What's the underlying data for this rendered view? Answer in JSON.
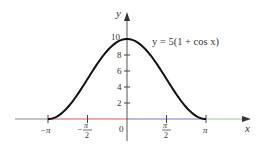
{
  "chart_data": {
    "type": "line",
    "title": "",
    "equation_label": "y = 5(1 + cos x)",
    "xlabel": "x",
    "ylabel": "y",
    "x_range": [
      -3.14159,
      3.14159
    ],
    "ylim": [
      0,
      10
    ],
    "x_ticks": [
      {
        "value": -3.14159,
        "label": "−π"
      },
      {
        "value": -1.5708,
        "label": "−π/2",
        "num": "π",
        "den": "2",
        "sign": "−"
      },
      {
        "value": 1.5708,
        "label": "π/2",
        "num": "π",
        "den": "2",
        "sign": ""
      },
      {
        "value": 3.14159,
        "label": "π"
      }
    ],
    "origin_label": "0",
    "y_ticks": [
      2,
      4,
      6,
      8,
      10
    ],
    "y_tick_labels": [
      "2",
      "4",
      "6",
      "8",
      "10"
    ],
    "series": [
      {
        "name": "y = 5(1 + cos x)",
        "function": "5*(1+cos(x))",
        "x": [
          -3.14159,
          -2.35619,
          -1.5708,
          -0.7854,
          0,
          0.7854,
          1.5708,
          2.35619,
          3.14159
        ],
        "y": [
          0,
          1.46,
          5,
          8.54,
          10,
          8.54,
          5,
          1.46,
          0
        ],
        "color": "#111111"
      }
    ],
    "axis_segments": [
      {
        "from": "-inf",
        "to": -3.14159,
        "color": "#8a8a8a"
      },
      {
        "from": -3.14159,
        "to": 0,
        "color": "#e0566a"
      },
      {
        "from": 0,
        "to": 3.14159,
        "color": "#7b74d6"
      },
      {
        "from": 3.14159,
        "to": "inf",
        "color": "#8fd08f"
      }
    ],
    "grid": false,
    "legend": "none"
  }
}
